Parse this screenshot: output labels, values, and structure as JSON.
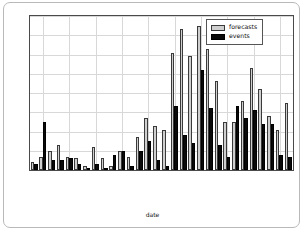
{
  "card": {
    "name": "chart-card"
  },
  "legend": {
    "position": "top-right",
    "entries": [
      {
        "label": "forecasts",
        "color": "#cfcfcf"
      },
      {
        "label": "events",
        "color": "#0a0a0a"
      }
    ]
  },
  "axes": {
    "y_ticks": [
      0,
      10,
      20,
      30,
      40,
      50,
      60,
      70,
      80
    ],
    "x_tick_labels": [
      "2013-06-02",
      "2013-06-05",
      "2013-06-08",
      "2013-06-11",
      "2013-06-14",
      "2013-06-17",
      "2013-06-20",
      "2013-06-23",
      "2013-06-26",
      "2013-06-29"
    ],
    "x_tick_indices": [
      1,
      4,
      7,
      10,
      13,
      16,
      19,
      22,
      25,
      28
    ],
    "xlabel": "date",
    "ylabel": ""
  },
  "chart_data": {
    "type": "bar",
    "title": "",
    "xlabel": "date",
    "ylabel": "",
    "ylim": [
      0,
      80
    ],
    "grid": true,
    "legend_position": "upper right",
    "categories": [
      "2013-06-01",
      "2013-06-02",
      "2013-06-03",
      "2013-06-04",
      "2013-06-05",
      "2013-06-06",
      "2013-06-07",
      "2013-06-08",
      "2013-06-09",
      "2013-06-10",
      "2013-06-11",
      "2013-06-12",
      "2013-06-13",
      "2013-06-14",
      "2013-06-15",
      "2013-06-16",
      "2013-06-17",
      "2013-06-18",
      "2013-06-19",
      "2013-06-20",
      "2013-06-21",
      "2013-06-22",
      "2013-06-23",
      "2013-06-24",
      "2013-06-25",
      "2013-06-26",
      "2013-06-27",
      "2013-06-28",
      "2013-06-29",
      "2013-06-30"
    ],
    "series": [
      {
        "name": "forecasts",
        "color": "#cfcfcf",
        "values": [
          4,
          7,
          10,
          13,
          7,
          6,
          2,
          12,
          6,
          2,
          10,
          7,
          17,
          27,
          23,
          21,
          61,
          73,
          59,
          75,
          63,
          46,
          25,
          25,
          36,
          53,
          42,
          28,
          21,
          35
        ]
      },
      {
        "name": "events",
        "color": "#0a0a0a",
        "values": [
          3,
          25,
          5,
          5,
          6,
          3,
          0,
          3,
          1,
          8,
          10,
          2,
          10,
          15,
          5,
          2,
          33,
          18,
          14,
          52,
          32,
          13,
          7,
          33,
          27,
          31,
          24,
          24,
          8,
          7
        ]
      }
    ]
  }
}
